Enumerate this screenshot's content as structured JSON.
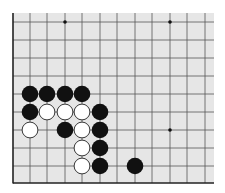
{
  "board": {
    "background": "#e6e6e6",
    "line_color": "#555555",
    "edge_color": "#222222",
    "area": {
      "left": 13,
      "top": 13,
      "right": 214,
      "bottom": 183
    },
    "vertical_lines_x": [
      30,
      47,
      65,
      82,
      100,
      117,
      135,
      152,
      170,
      187,
      205
    ],
    "horizontal_lines_y": [
      22,
      40,
      58,
      76,
      94,
      112,
      130,
      148,
      166
    ],
    "left_edge_x": 13,
    "bottom_edge_y": 183,
    "star_points": [
      {
        "x": 65,
        "y": 22
      },
      {
        "x": 170,
        "y": 22
      },
      {
        "x": 170,
        "y": 130
      }
    ],
    "stone_radius": 8.3,
    "stones": [
      {
        "color": "black",
        "x": 30,
        "y": 94
      },
      {
        "color": "black",
        "x": 47,
        "y": 94
      },
      {
        "color": "black",
        "x": 65,
        "y": 94
      },
      {
        "color": "black",
        "x": 82,
        "y": 94
      },
      {
        "color": "black",
        "x": 30,
        "y": 112
      },
      {
        "color": "white",
        "x": 47,
        "y": 112
      },
      {
        "color": "white",
        "x": 65,
        "y": 112
      },
      {
        "color": "white",
        "x": 82,
        "y": 112
      },
      {
        "color": "black",
        "x": 100,
        "y": 112
      },
      {
        "color": "white",
        "x": 30,
        "y": 130
      },
      {
        "color": "black",
        "x": 65,
        "y": 130
      },
      {
        "color": "white",
        "x": 82,
        "y": 130
      },
      {
        "color": "black",
        "x": 100,
        "y": 130
      },
      {
        "color": "white",
        "x": 82,
        "y": 148
      },
      {
        "color": "black",
        "x": 100,
        "y": 148
      },
      {
        "color": "white",
        "x": 82,
        "y": 166
      },
      {
        "color": "black",
        "x": 100,
        "y": 166
      },
      {
        "color": "black",
        "x": 135,
        "y": 166
      }
    ]
  }
}
